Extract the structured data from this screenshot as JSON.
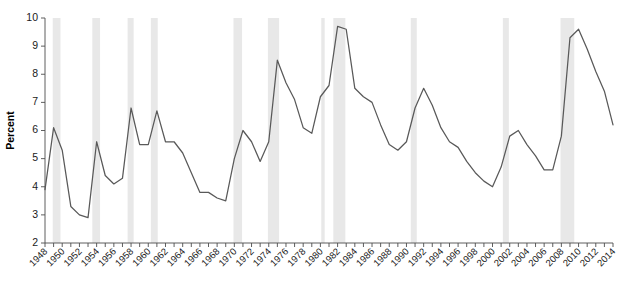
{
  "chart_data": {
    "type": "line",
    "title": "",
    "xlabel": "",
    "ylabel": "Percent",
    "ylim": [
      2,
      10
    ],
    "xlim": [
      1948,
      2014
    ],
    "grid": false,
    "legend": "none",
    "y_ticks": [
      2,
      3,
      4,
      5,
      6,
      7,
      8,
      9,
      10
    ],
    "y_tick_labels": [
      "2",
      "3",
      "4",
      "5",
      "6",
      "7",
      "8",
      "9",
      "10"
    ],
    "x_tick_labels": [
      "1948",
      "1950",
      "1952",
      "1954",
      "1956",
      "1958",
      "1960",
      "1962",
      "1964",
      "1966",
      "1968",
      "1970",
      "1972",
      "1974",
      "1976",
      "1978",
      "1980",
      "1982",
      "1984",
      "1986",
      "1988",
      "1990",
      "1992",
      "1994",
      "1996",
      "1998",
      "2000",
      "2002",
      "2004",
      "2006",
      "2008",
      "2010",
      "2012",
      "2014"
    ],
    "x_tick_years": [
      1948,
      1950,
      1952,
      1954,
      1956,
      1958,
      1960,
      1962,
      1964,
      1966,
      1968,
      1970,
      1972,
      1974,
      1976,
      1978,
      1980,
      1982,
      1984,
      1986,
      1988,
      1990,
      1992,
      1994,
      1996,
      1998,
      2000,
      2002,
      2004,
      2006,
      2008,
      2010,
      2012,
      2014
    ],
    "x_minor_years": [
      1949,
      1951,
      1953,
      1955,
      1957,
      1959,
      1961,
      1963,
      1965,
      1967,
      1969,
      1971,
      1973,
      1975,
      1977,
      1979,
      1981,
      1983,
      1985,
      1987,
      1989,
      1991,
      1993,
      1995,
      1997,
      1999,
      2001,
      2003,
      2005,
      2007,
      2009,
      2011,
      2013
    ],
    "x": [
      1948,
      1949,
      1950,
      1951,
      1952,
      1953,
      1954,
      1955,
      1956,
      1957,
      1958,
      1959,
      1960,
      1961,
      1962,
      1963,
      1964,
      1965,
      1966,
      1967,
      1968,
      1969,
      1970,
      1971,
      1972,
      1973,
      1974,
      1975,
      1976,
      1977,
      1978,
      1979,
      1980,
      1981,
      1982,
      1983,
      1984,
      1985,
      1986,
      1987,
      1988,
      1989,
      1990,
      1991,
      1992,
      1993,
      1994,
      1995,
      1996,
      1997,
      1998,
      1999,
      2000,
      2001,
      2002,
      2003,
      2004,
      2005,
      2006,
      2007,
      2008,
      2009,
      2010,
      2011,
      2012,
      2013,
      2014
    ],
    "values": [
      3.9,
      6.1,
      5.3,
      3.3,
      3.0,
      2.9,
      5.6,
      4.4,
      4.1,
      4.3,
      6.8,
      5.5,
      5.5,
      6.7,
      5.6,
      5.6,
      5.2,
      4.5,
      3.8,
      3.8,
      3.6,
      3.5,
      5.0,
      6.0,
      5.6,
      4.9,
      5.6,
      8.5,
      7.7,
      7.1,
      6.1,
      5.9,
      7.2,
      7.6,
      9.7,
      9.6,
      7.5,
      7.2,
      7.0,
      6.2,
      5.5,
      5.3,
      5.6,
      6.8,
      7.5,
      6.9,
      6.1,
      5.6,
      5.4,
      4.9,
      4.5,
      4.2,
      4.0,
      4.7,
      5.8,
      6.0,
      5.5,
      5.1,
      4.6,
      4.6,
      5.8,
      9.3,
      9.6,
      8.9,
      8.1,
      7.4,
      6.2
    ],
    "series_color": "#595959",
    "recession_shading_color": "#e8e8e8",
    "recession_bands": [
      {
        "start": 1948.9,
        "end": 1949.8
      },
      {
        "start": 1953.5,
        "end": 1954.4
      },
      {
        "start": 1957.6,
        "end": 1958.3
      },
      {
        "start": 1960.3,
        "end": 1961.1
      },
      {
        "start": 1969.9,
        "end": 1970.9
      },
      {
        "start": 1973.9,
        "end": 1975.2
      },
      {
        "start": 1980.1,
        "end": 1980.5
      },
      {
        "start": 1981.5,
        "end": 1982.9
      },
      {
        "start": 1990.5,
        "end": 1991.2
      },
      {
        "start": 2001.2,
        "end": 2001.9
      },
      {
        "start": 2007.9,
        "end": 2009.5
      }
    ]
  }
}
